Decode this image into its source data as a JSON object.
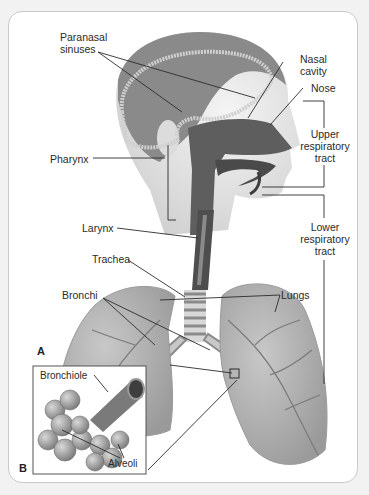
{
  "figure": {
    "panels": [
      "A",
      "B"
    ],
    "labels": {
      "paranasal_sinuses": [
        "Paranasal",
        "sinuses"
      ],
      "nasal_cavity": [
        "Nasal",
        "cavity"
      ],
      "nose": "Nose",
      "upper_tract": [
        "Upper",
        "respiratory",
        "tract"
      ],
      "pharynx": "Pharynx",
      "larynx": "Larynx",
      "lower_tract": [
        "Lower",
        "respiratory",
        "tract"
      ],
      "trachea": "Trachea",
      "bronchi": "Bronchi",
      "lungs": "Lungs",
      "bronchiole": "Bronchiole",
      "alveoli": "Alveoli"
    }
  },
  "colors": {
    "line": "#2b2b2b",
    "tissue_dark": "#5a5a5a",
    "tissue_mid": "#8d8d8d",
    "lung": "#a9a9a9",
    "skin": "#e6e6e6",
    "hair": "#7a7a7a",
    "frame_border": "#c9c9c9"
  }
}
